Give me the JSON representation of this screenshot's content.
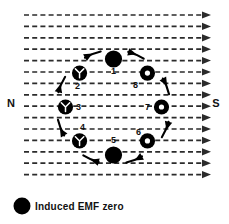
{
  "figure": {
    "poles": {
      "north_label": "N",
      "south_label": "S"
    },
    "field": {
      "direction": "left-to-right",
      "line_count": 15,
      "style": "dashed-with-arrowhead",
      "color": "#2b2b2b"
    },
    "rotation": {
      "sense": "clockwise",
      "arrow_color": "#000000"
    },
    "positions": [
      {
        "number": "1",
        "label_dx": 0,
        "label_dy": 15,
        "symbol": "solid",
        "angle": -90,
        "desc": "top"
      },
      {
        "number": "2",
        "label_dx": -2,
        "label_dy": 16,
        "symbol": "tail",
        "angle": -135,
        "desc": "upper-left"
      },
      {
        "number": "3",
        "label_dx": 13,
        "label_dy": 3,
        "symbol": "tail",
        "angle": 180,
        "desc": "left"
      },
      {
        "number": "4",
        "label_dx": 3,
        "label_dy": -11,
        "symbol": "tail",
        "angle": 135,
        "desc": "lower-left"
      },
      {
        "number": "5",
        "label_dx": 0,
        "label_dy": -12,
        "symbol": "solid",
        "angle": 90,
        "desc": "bottom"
      },
      {
        "number": "6",
        "label_dx": -9,
        "label_dy": -6,
        "symbol": "dot",
        "angle": 45,
        "desc": "lower-right"
      },
      {
        "number": "7",
        "label_dx": -14,
        "label_dy": 3,
        "symbol": "dot",
        "angle": 0,
        "desc": "right"
      },
      {
        "number": "8",
        "label_dx": -12,
        "label_dy": 15,
        "symbol": "dot",
        "angle": -45,
        "desc": "upper-right"
      }
    ],
    "legend": {
      "marker_symbol": "solid",
      "marker_color": "#000000",
      "text": "Induced  EMF  zero"
    }
  }
}
